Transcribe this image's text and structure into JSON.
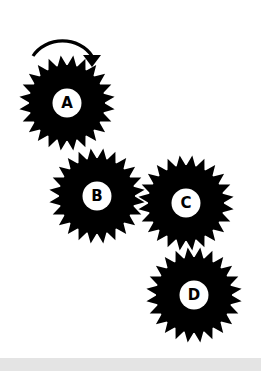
{
  "diagram": {
    "rotation_arrow": {
      "target": "A",
      "direction": "clockwise"
    },
    "gears": [
      {
        "id": "A",
        "label": "A",
        "cx": 67,
        "cy": 103,
        "teeth": 24
      },
      {
        "id": "B",
        "label": "B",
        "cx": 97,
        "cy": 196,
        "teeth": 24
      },
      {
        "id": "C",
        "label": "C",
        "cx": 186,
        "cy": 203,
        "teeth": 24
      },
      {
        "id": "D",
        "label": "D",
        "cx": 194,
        "cy": 295,
        "teeth": 24
      }
    ],
    "colors": {
      "gear": "#000000",
      "hub": "#ffffff",
      "background": "#ffffff",
      "band": "#e4e4e4"
    }
  }
}
